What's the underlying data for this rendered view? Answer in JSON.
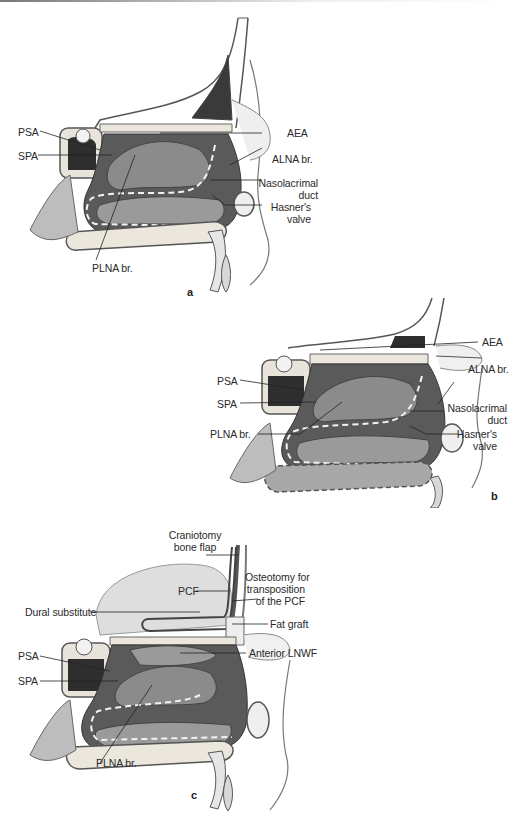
{
  "figure": {
    "panels": [
      {
        "id": "a",
        "letter": "a",
        "labels": {
          "psa": "PSA",
          "spa": "SPA",
          "plna": "PLNA br.",
          "aea": "AEA",
          "alna": "ALNA br.",
          "naso1": "Nasolacrimal",
          "naso2": "duct",
          "hasner1": "Hasner's",
          "hasner2": "valve"
        }
      },
      {
        "id": "b",
        "letter": "b",
        "labels": {
          "aea": "AEA",
          "alna": "ALNA br.",
          "psa": "PSA",
          "spa": "SPA",
          "plna": "PLNA br.",
          "naso1": "Nasolacrimal",
          "naso2": "duct",
          "hasner1": "Hasner's",
          "hasner2": "valve"
        }
      },
      {
        "id": "c",
        "letter": "c",
        "labels": {
          "cranio1": "Craniotomy",
          "cranio2": "bone flap",
          "pcf": "PCF",
          "osteo1": "Osteotomy for",
          "osteo2": "transposition",
          "osteo3": "of the PCF",
          "dural": "Dural substitute",
          "fat": "Fat graft",
          "psa": "PSA",
          "lnwf": "Anterior LNWF",
          "spa": "SPA",
          "plna": "PLNA br."
        }
      }
    ]
  }
}
